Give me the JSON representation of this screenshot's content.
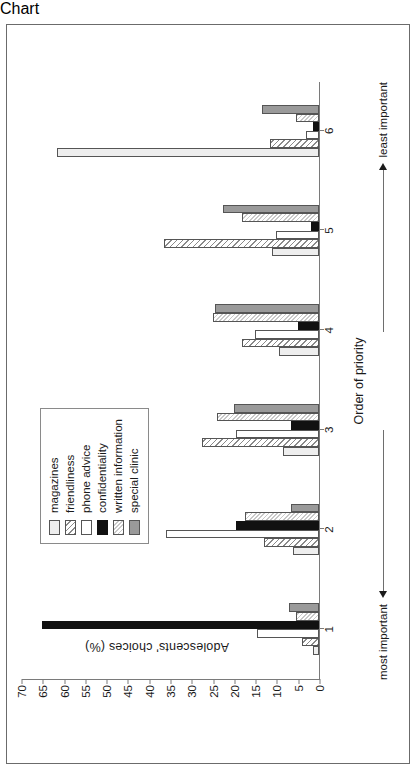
{
  "chart_data": {
    "type": "bar",
    "title": "",
    "xlabel": "Order of priority",
    "ylabel": "Adolescents' choices (%)",
    "ylim": [
      0,
      70
    ],
    "ytick_step": 5,
    "yticks": [
      "0",
      "5",
      "10",
      "15",
      "20",
      "25",
      "30",
      "35",
      "40",
      "45",
      "50",
      "55",
      "60",
      "65",
      "70"
    ],
    "categories": [
      "1",
      "2",
      "3",
      "4",
      "5",
      "6"
    ],
    "grid": false,
    "legend_position": "upper-middle-right",
    "annotations": {
      "left_arrow_label": "most important",
      "right_arrow_label": "least important"
    },
    "series": [
      {
        "name": "magazines",
        "fill": "light-grey",
        "values": [
          1.5,
          6.0,
          8.5,
          9.5,
          11.0,
          61.5
        ]
      },
      {
        "name": "friendliness",
        "fill": "dark-hatch",
        "values": [
          4.0,
          13.0,
          27.5,
          18.0,
          36.5,
          11.5
        ]
      },
      {
        "name": "phone advice",
        "fill": "white",
        "values": [
          14.5,
          36.0,
          19.5,
          15.0,
          10.0,
          3.0
        ]
      },
      {
        "name": "confidentiality",
        "fill": "black",
        "values": [
          65.0,
          19.5,
          6.5,
          5.0,
          2.0,
          1.5
        ]
      },
      {
        "name": "written information",
        "fill": "light-hatch",
        "values": [
          5.5,
          17.5,
          24.0,
          25.0,
          18.0,
          5.5
        ]
      },
      {
        "name": "special clinic",
        "fill": "mid-grey",
        "values": [
          7.0,
          6.5,
          20.0,
          24.5,
          22.5,
          13.5
        ]
      }
    ]
  },
  "legend": {
    "items": [
      "magazines",
      "friendliness",
      "phone advice",
      "confidentiality",
      "written information",
      "special clinic"
    ]
  }
}
